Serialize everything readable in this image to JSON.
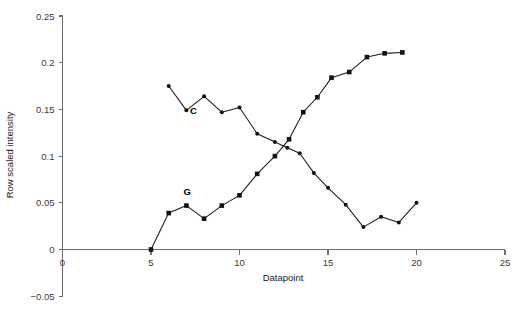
{
  "chart_data": {
    "type": "line",
    "title": "",
    "xlabel": "Datapoint",
    "ylabel": "Row scaled intensity",
    "xlim": [
      0,
      25
    ],
    "ylim": [
      -0.05,
      0.25
    ],
    "xticks": [
      0,
      5,
      10,
      15,
      20,
      25
    ],
    "xtick_labels": [
      "0",
      "5",
      "10",
      "15",
      "20",
      "25"
    ],
    "yticks": [
      -0.05,
      0,
      0.05,
      0.1,
      0.15,
      0.2,
      0.25
    ],
    "ytick_labels": [
      "-0.05",
      "0",
      "0.05",
      "0.1",
      "0.15",
      "0.2",
      "0.25"
    ],
    "grid": false,
    "legend": "inline-annotations",
    "series": [
      {
        "name": "C",
        "marker": "circle",
        "label_text": "C",
        "label_x": 7.4,
        "label_y": 0.1455,
        "x": [
          6,
          7,
          8,
          9,
          10,
          11,
          12,
          12.7,
          13.4,
          14.2,
          15,
          16,
          17,
          18,
          19,
          20
        ],
        "y": [
          0.175,
          0.149,
          0.164,
          0.147,
          0.152,
          0.124,
          0.115,
          0.109,
          0.103,
          0.082,
          0.066,
          0.048,
          0.024,
          0.035,
          0.029,
          0.05
        ]
      },
      {
        "name": "G",
        "marker": "square",
        "label_text": "G",
        "label_x": 7.05,
        "label_y": 0.0585,
        "x": [
          5,
          6,
          7,
          8,
          9,
          10,
          11,
          12,
          12.8,
          13.6,
          14.4,
          15.2,
          16.2,
          17.2,
          18.2,
          19.2
        ],
        "y": [
          0.0,
          0.039,
          0.047,
          0.033,
          0.047,
          0.058,
          0.081,
          0.1,
          0.118,
          0.147,
          0.163,
          0.184,
          0.19,
          0.206,
          0.21,
          0.211
        ]
      }
    ]
  }
}
